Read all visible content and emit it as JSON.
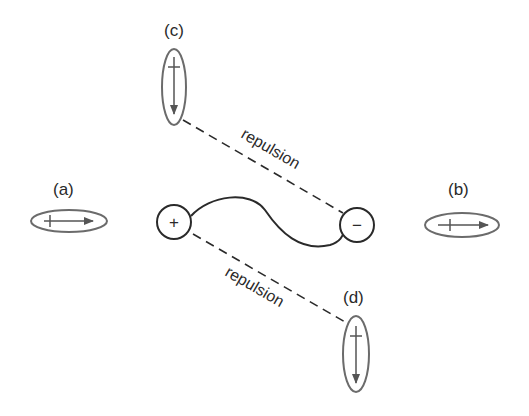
{
  "diagram": {
    "labels": {
      "a": "(a)",
      "b": "(b)",
      "c": "(c)",
      "d": "(d)"
    },
    "interaction_labels": {
      "upper": "repulsion",
      "lower": "repulsion"
    },
    "charges": {
      "positive": "+",
      "negative": "−"
    },
    "colors": {
      "dipole_outline": "#6b6b6b",
      "ion_outline": "#2a2a2a",
      "text": "#2a2a2a"
    }
  }
}
